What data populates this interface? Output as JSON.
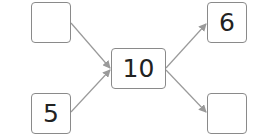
{
  "diagram": {
    "type": "number-bond",
    "center": {
      "value": "10"
    },
    "left_top": {
      "value": ""
    },
    "left_bottom": {
      "value": "5"
    },
    "right_top": {
      "value": "6"
    },
    "right_bottom": {
      "value": ""
    }
  },
  "colors": {
    "border": "#8a8a8a",
    "arrow": "#9a9a9a",
    "text": "#222222"
  }
}
